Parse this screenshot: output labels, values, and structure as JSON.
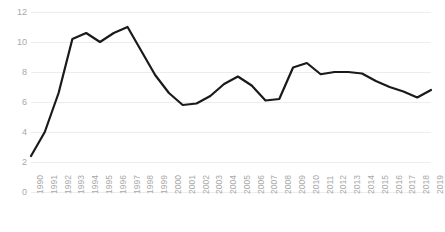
{
  "chart_data": {
    "type": "line",
    "title": "",
    "subtitle": "",
    "xlabel": "",
    "ylabel": "",
    "xlim": [
      1990,
      2019
    ],
    "ylim": [
      0,
      12
    ],
    "y_ticks": [
      0,
      2,
      4,
      6,
      8,
      10,
      12
    ],
    "grid": true,
    "grid_axis": "y",
    "legend": false,
    "legend_position": "none",
    "line_color": "#1a1a1a",
    "line_width": 2.2,
    "grid_color": "#ededed",
    "tick_label_color": "#a8a8a8",
    "background_color": "#ffffff",
    "categories": [
      "1990",
      "1991",
      "1992",
      "1993",
      "1994",
      "1995",
      "1996",
      "1997",
      "1998",
      "1999",
      "2000",
      "2001",
      "2002",
      "2003",
      "2004",
      "2005",
      "2006",
      "2007",
      "2008",
      "2009",
      "2010",
      "2011",
      "2012",
      "2013",
      "2014",
      "2015",
      "2016",
      "2017",
      "2018",
      "2019"
    ],
    "values": [
      2.4,
      4.0,
      6.6,
      10.2,
      10.6,
      10.0,
      10.6,
      11.0,
      9.4,
      7.8,
      6.6,
      5.8,
      5.9,
      6.4,
      7.2,
      7.7,
      7.1,
      6.1,
      6.2,
      8.3,
      8.6,
      7.85,
      8.0,
      8.0,
      7.9,
      7.4,
      7.0,
      6.7,
      6.3,
      6.8
    ],
    "series": [
      {
        "name": "series-1",
        "values": [
          2.4,
          4.0,
          6.6,
          10.2,
          10.6,
          10.0,
          10.6,
          11.0,
          9.4,
          7.8,
          6.6,
          5.8,
          5.9,
          6.4,
          7.2,
          7.7,
          7.1,
          6.1,
          6.2,
          8.3,
          8.6,
          7.85,
          8.0,
          8.0,
          7.9,
          7.4,
          7.0,
          6.7,
          6.3,
          6.8
        ]
      }
    ]
  }
}
